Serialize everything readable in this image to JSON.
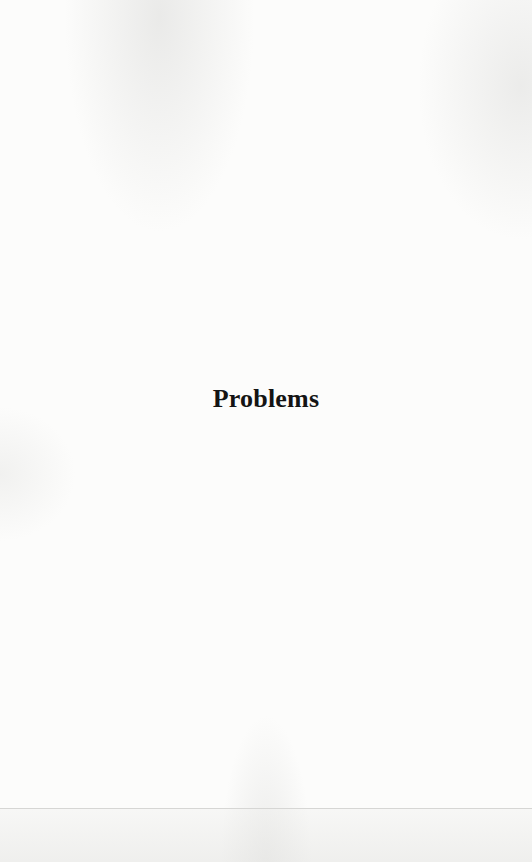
{
  "page": {
    "section_title": "Problems"
  }
}
